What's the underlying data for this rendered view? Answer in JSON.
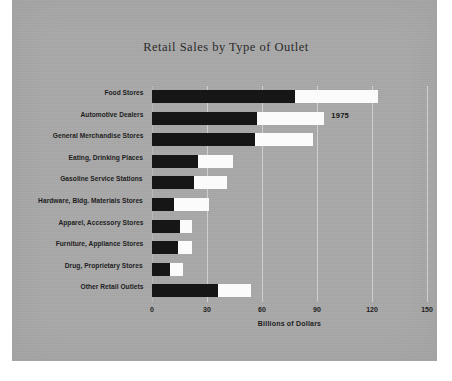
{
  "chart_data": {
    "type": "bar",
    "orientation": "horizontal",
    "stacked": true,
    "title": "Retail Sales by Type of Outlet",
    "xlabel": "Billions of Dollars",
    "ylabel": "",
    "xlim": [
      0,
      150
    ],
    "xticks": [
      0,
      30,
      60,
      90,
      120,
      150
    ],
    "xticklabels": [
      "0",
      "30",
      "60",
      "90",
      "120",
      "150"
    ],
    "grid": true,
    "legend": false,
    "annotations": [
      {
        "text": "1975",
        "category": "Automotive Dealers",
        "value": 94
      }
    ],
    "categories": [
      "Food Stores",
      "Automotive Dealers",
      "General Merchandise Stores",
      "Eating, Drinking Places",
      "Gasoline Service Stations",
      "Hardware, Bldg. Materials Stores",
      "Apparel,  Accessory Stores",
      "Furniture, Appliance Stores",
      "Drug, Proprietary Stores",
      "Other Retail Outlets"
    ],
    "series": [
      {
        "name": "dark",
        "color": "#161616",
        "values": [
          78,
          57,
          56,
          25,
          23,
          12,
          15,
          14,
          10,
          36
        ]
      },
      {
        "name": "light",
        "color": "#fbfbfb",
        "values": [
          45,
          37,
          32,
          19,
          18,
          19,
          7,
          8,
          7,
          18
        ]
      }
    ],
    "totals": [
      123,
      94,
      88,
      44,
      41,
      31,
      22,
      22,
      17,
      54
    ]
  },
  "colors": {
    "panel_background": "#a8a8a8",
    "page_background": "#ffffff",
    "dark_bar": "#161616",
    "light_bar": "#fbfbfb",
    "gridline": "#cfcfcf",
    "text": "#1d1d1d"
  }
}
